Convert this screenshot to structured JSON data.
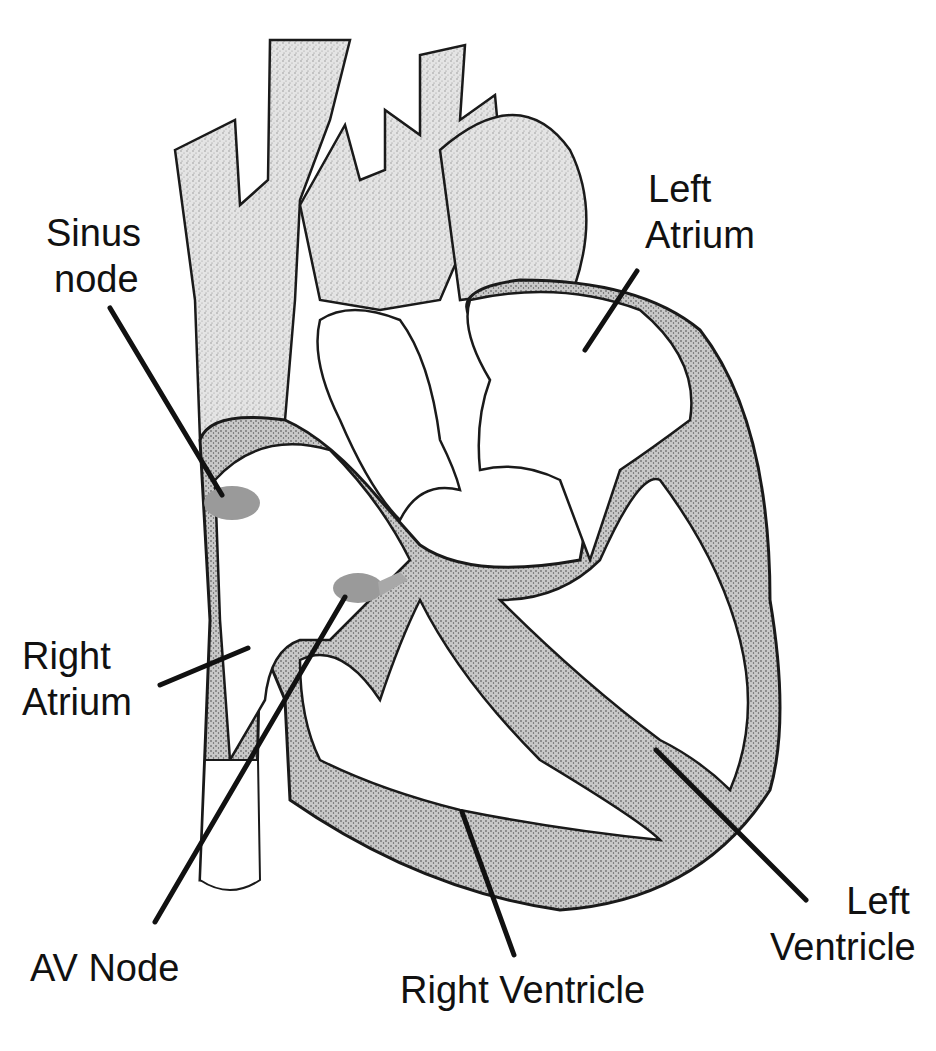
{
  "diagram": {
    "colors": {
      "background": "#ffffff",
      "outline": "#1a1a1a",
      "tissue_fill": "#d9d9d9",
      "vessel_fill": "#e6e6e6",
      "node_fill": "#9a9a9a",
      "leader_line": "#111111",
      "label_text": "#111111"
    },
    "labels": {
      "sinus_node": {
        "line1": "Sinus",
        "line2": "node"
      },
      "left_atrium": {
        "line1": "Left",
        "line2": "Atrium"
      },
      "right_atrium": {
        "line1": "Right",
        "line2": "Atrium"
      },
      "av_node": {
        "line1": "AV Node"
      },
      "right_ventricle": {
        "line1": "Right Ventricle"
      },
      "left_ventricle": {
        "line1": "Left",
        "line2": "Ventricle"
      }
    }
  }
}
